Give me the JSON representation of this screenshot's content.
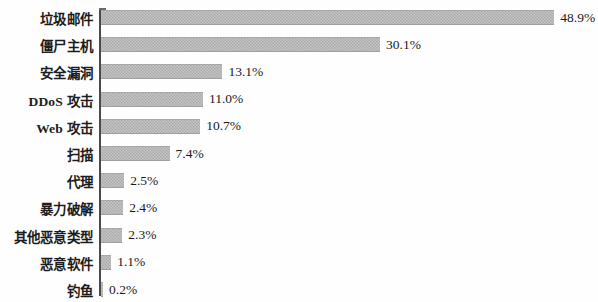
{
  "chart_data": {
    "type": "bar",
    "orientation": "horizontal",
    "title": "",
    "subtitle": "",
    "xlabel": "",
    "ylabel": "",
    "grid": false,
    "legend": null,
    "xlim": [
      0,
      53.7
    ],
    "value_suffix": "%",
    "categories": [
      "垃圾邮件",
      "僵尸主机",
      "安全漏洞",
      "DDoS 攻击",
      "Web 攻击",
      "扫描",
      "代理",
      "暴力破解",
      "其他恶意类型",
      "恶意软件",
      "钓鱼"
    ],
    "values": [
      48.9,
      30.1,
      13.1,
      11.0,
      10.7,
      7.4,
      2.5,
      2.4,
      2.3,
      1.1,
      0.2
    ],
    "data_labels": [
      "48.9%",
      "30.1%",
      "13.1%",
      "11.0%",
      "10.7%",
      "7.4%",
      "2.5%",
      "2.4%",
      "2.3%",
      "1.1%",
      "0.2%"
    ],
    "colors": {
      "bar_fill": "#b2b2b2",
      "axis": "#4a4a4a",
      "text": "#1a1a1a",
      "background": "#fefefe"
    }
  }
}
